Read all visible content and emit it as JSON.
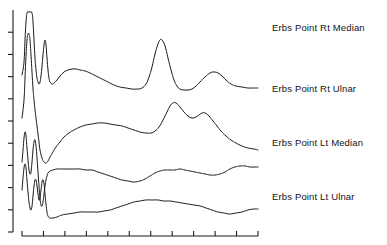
{
  "figure": {
    "kind": "waveform-plot",
    "background_color": "#ffffff",
    "trace_color": "#1a1a1a",
    "axis_color": "#1a1a1a",
    "width": 387,
    "height": 245
  },
  "labels": [
    {
      "text": "Erbs Point Rt Median"
    },
    {
      "text": "Erbs Point Rt Ulnar"
    },
    {
      "text": "Erbs Point Lt Median"
    },
    {
      "text": "Erbs Point Lt Ulnar"
    }
  ],
  "chart_data": {
    "type": "line",
    "title": "",
    "xlabel": "",
    "ylabel": "",
    "grid": false,
    "legend_position": "right",
    "axis": {
      "y_axis_x": 13,
      "y_axis_top": 10,
      "y_axis_bottom": 232,
      "y_tick_count": 10,
      "y_tick_length": 5,
      "x_axis_y": 236,
      "x_axis_left": 22,
      "x_axis_right": 258,
      "x_tick_count": 12,
      "x_tick_length": 5
    },
    "xlim": [
      0,
      258
    ],
    "ylim": [
      0,
      245
    ],
    "series": [
      {
        "name": "Erbs Point Rt Median",
        "baseline_y": 88,
        "peak_amplitude_px": 50,
        "peak_x": 160,
        "secondary_peak_x": 215,
        "points": [
          [
            22,
            75
          ],
          [
            24,
            62
          ],
          [
            25,
            40
          ],
          [
            26,
            22
          ],
          [
            27,
            13
          ],
          [
            28,
            12
          ],
          [
            30,
            12
          ],
          [
            32,
            13
          ],
          [
            33,
            22
          ],
          [
            34,
            40
          ],
          [
            35,
            58
          ],
          [
            36,
            70
          ],
          [
            37,
            78
          ],
          [
            38,
            82
          ],
          [
            39,
            84
          ],
          [
            40,
            82
          ],
          [
            41,
            76
          ],
          [
            42,
            66
          ],
          [
            43,
            55
          ],
          [
            44,
            45
          ],
          [
            45,
            40
          ],
          [
            46,
            45
          ],
          [
            47,
            58
          ],
          [
            48,
            70
          ],
          [
            49,
            78
          ],
          [
            50,
            82
          ],
          [
            52,
            84
          ],
          [
            54,
            83
          ],
          [
            57,
            80
          ],
          [
            60,
            76
          ],
          [
            64,
            72
          ],
          [
            68,
            70
          ],
          [
            72,
            69
          ],
          [
            76,
            69
          ],
          [
            80,
            70
          ],
          [
            85,
            71
          ],
          [
            90,
            73
          ],
          [
            96,
            76
          ],
          [
            102,
            79
          ],
          [
            108,
            82
          ],
          [
            114,
            85
          ],
          [
            120,
            87
          ],
          [
            126,
            88
          ],
          [
            132,
            89
          ],
          [
            138,
            89
          ],
          [
            142,
            88
          ],
          [
            146,
            84
          ],
          [
            149,
            77
          ],
          [
            152,
            67
          ],
          [
            155,
            54
          ],
          [
            158,
            44
          ],
          [
            160,
            40
          ],
          [
            162,
            40
          ],
          [
            165,
            46
          ],
          [
            168,
            58
          ],
          [
            171,
            70
          ],
          [
            174,
            80
          ],
          [
            177,
            86
          ],
          [
            180,
            89
          ],
          [
            184,
            90
          ],
          [
            188,
            90
          ],
          [
            192,
            89
          ],
          [
            196,
            86
          ],
          [
            200,
            82
          ],
          [
            205,
            77
          ],
          [
            210,
            73
          ],
          [
            214,
            72
          ],
          [
            218,
            73
          ],
          [
            222,
            76
          ],
          [
            226,
            80
          ],
          [
            231,
            84
          ],
          [
            236,
            86
          ],
          [
            242,
            87
          ],
          [
            248,
            88
          ],
          [
            254,
            88
          ],
          [
            258,
            88
          ]
        ]
      },
      {
        "name": "Erbs Point Rt Ulnar",
        "baseline_y": 133,
        "peak_amplitude_px": 30,
        "peak_x": 172,
        "secondary_peak_x": 202,
        "points": [
          [
            22,
            118
          ],
          [
            24,
            100
          ],
          [
            25,
            78
          ],
          [
            26,
            56
          ],
          [
            27,
            40
          ],
          [
            28,
            34
          ],
          [
            29,
            34
          ],
          [
            30,
            40
          ],
          [
            31,
            55
          ],
          [
            32,
            72
          ],
          [
            33,
            88
          ],
          [
            34,
            100
          ],
          [
            35,
            110
          ],
          [
            36,
            118
          ],
          [
            37,
            126
          ],
          [
            38,
            134
          ],
          [
            39,
            142
          ],
          [
            40,
            150
          ],
          [
            42,
            158
          ],
          [
            44,
            162
          ],
          [
            46,
            163
          ],
          [
            48,
            161
          ],
          [
            50,
            157
          ],
          [
            53,
            152
          ],
          [
            56,
            147
          ],
          [
            60,
            142
          ],
          [
            64,
            137
          ],
          [
            69,
            133
          ],
          [
            74,
            130
          ],
          [
            80,
            127
          ],
          [
            86,
            125
          ],
          [
            92,
            124
          ],
          [
            98,
            123
          ],
          [
            104,
            123
          ],
          [
            110,
            124
          ],
          [
            116,
            125
          ],
          [
            122,
            126
          ],
          [
            128,
            128
          ],
          [
            134,
            130
          ],
          [
            140,
            132
          ],
          [
            146,
            133
          ],
          [
            151,
            133
          ],
          [
            155,
            131
          ],
          [
            159,
            127
          ],
          [
            163,
            120
          ],
          [
            167,
            112
          ],
          [
            170,
            106
          ],
          [
            173,
            103
          ],
          [
            176,
            103
          ],
          [
            180,
            107
          ],
          [
            184,
            112
          ],
          [
            188,
            116
          ],
          [
            192,
            118
          ],
          [
            196,
            117
          ],
          [
            199,
            115
          ],
          [
            202,
            113
          ],
          [
            205,
            113
          ],
          [
            209,
            116
          ],
          [
            213,
            121
          ],
          [
            217,
            126
          ],
          [
            221,
            131
          ],
          [
            226,
            136
          ],
          [
            231,
            140
          ],
          [
            236,
            143
          ],
          [
            242,
            146
          ],
          [
            248,
            148
          ],
          [
            254,
            149
          ],
          [
            258,
            150
          ]
        ]
      },
      {
        "name": "Erbs Point Lt Median",
        "baseline_y": 170,
        "peak_amplitude_px": 8,
        "peak_x": 180,
        "secondary_peak_x": 230,
        "points": [
          [
            22,
            162
          ],
          [
            23,
            150
          ],
          [
            24,
            138
          ],
          [
            25,
            132
          ],
          [
            26,
            136
          ],
          [
            27,
            148
          ],
          [
            28,
            160
          ],
          [
            29,
            170
          ],
          [
            30,
            174
          ],
          [
            31,
            172
          ],
          [
            32,
            162
          ],
          [
            33,
            150
          ],
          [
            34,
            142
          ],
          [
            35,
            140
          ],
          [
            36,
            146
          ],
          [
            37,
            158
          ],
          [
            38,
            172
          ],
          [
            39,
            186
          ],
          [
            40,
            198
          ],
          [
            41,
            205
          ],
          [
            42,
            206
          ],
          [
            43,
            202
          ],
          [
            44,
            194
          ],
          [
            45,
            186
          ],
          [
            46,
            180
          ],
          [
            47,
            176
          ],
          [
            48,
            173
          ],
          [
            50,
            171
          ],
          [
            53,
            170
          ],
          [
            57,
            169
          ],
          [
            62,
            169
          ],
          [
            68,
            169
          ],
          [
            74,
            169
          ],
          [
            80,
            169
          ],
          [
            86,
            170
          ],
          [
            92,
            170
          ],
          [
            98,
            172
          ],
          [
            104,
            174
          ],
          [
            110,
            176
          ],
          [
            116,
            178
          ],
          [
            122,
            180
          ],
          [
            128,
            181
          ],
          [
            134,
            182
          ],
          [
            140,
            181
          ],
          [
            145,
            179
          ],
          [
            150,
            176
          ],
          [
            155,
            173
          ],
          [
            160,
            171
          ],
          [
            165,
            170
          ],
          [
            170,
            170
          ],
          [
            175,
            170
          ],
          [
            180,
            169
          ],
          [
            185,
            170
          ],
          [
            190,
            171
          ],
          [
            195,
            172
          ],
          [
            200,
            173
          ],
          [
            205,
            174
          ],
          [
            210,
            175
          ],
          [
            215,
            175
          ],
          [
            220,
            174
          ],
          [
            225,
            172
          ],
          [
            230,
            169
          ],
          [
            235,
            167
          ],
          [
            240,
            166
          ],
          [
            245,
            166
          ],
          [
            250,
            167
          ],
          [
            254,
            167
          ],
          [
            258,
            167
          ]
        ]
      },
      {
        "name": "Erbs Point Lt Ulnar",
        "baseline_y": 208,
        "peak_amplitude_px": 7,
        "peak_x": 150,
        "secondary_peak_x": 205,
        "points": [
          [
            22,
            190
          ],
          [
            23,
            178
          ],
          [
            24,
            168
          ],
          [
            25,
            164
          ],
          [
            26,
            168
          ],
          [
            27,
            180
          ],
          [
            28,
            192
          ],
          [
            29,
            202
          ],
          [
            30,
            208
          ],
          [
            31,
            210
          ],
          [
            32,
            206
          ],
          [
            33,
            196
          ],
          [
            34,
            186
          ],
          [
            35,
            180
          ],
          [
            36,
            180
          ],
          [
            37,
            186
          ],
          [
            38,
            194
          ],
          [
            39,
            200
          ],
          [
            40,
            198
          ],
          [
            41,
            190
          ],
          [
            42,
            182
          ],
          [
            43,
            180
          ],
          [
            44,
            184
          ],
          [
            45,
            194
          ],
          [
            46,
            204
          ],
          [
            47,
            212
          ],
          [
            48,
            216
          ],
          [
            50,
            218
          ],
          [
            53,
            218
          ],
          [
            57,
            217
          ],
          [
            62,
            215
          ],
          [
            68,
            214
          ],
          [
            74,
            213
          ],
          [
            80,
            212
          ],
          [
            86,
            212
          ],
          [
            92,
            212
          ],
          [
            98,
            212
          ],
          [
            104,
            211
          ],
          [
            110,
            210
          ],
          [
            116,
            208
          ],
          [
            122,
            206
          ],
          [
            128,
            204
          ],
          [
            134,
            202
          ],
          [
            140,
            201
          ],
          [
            146,
            200
          ],
          [
            152,
            200
          ],
          [
            158,
            200
          ],
          [
            164,
            201
          ],
          [
            170,
            201
          ],
          [
            176,
            202
          ],
          [
            182,
            203
          ],
          [
            188,
            204
          ],
          [
            194,
            205
          ],
          [
            200,
            206
          ],
          [
            206,
            208
          ],
          [
            212,
            210
          ],
          [
            218,
            212
          ],
          [
            224,
            213
          ],
          [
            230,
            214
          ],
          [
            236,
            213
          ],
          [
            242,
            212
          ],
          [
            248,
            210
          ],
          [
            254,
            209
          ],
          [
            258,
            209
          ]
        ]
      }
    ]
  }
}
